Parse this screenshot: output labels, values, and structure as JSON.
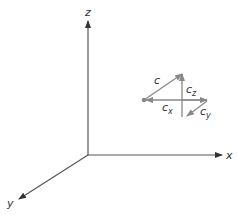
{
  "diagram": {
    "axes": {
      "x_label": "x",
      "y_label": "y",
      "z_label": "z"
    },
    "vectors": {
      "c": {
        "label": "c"
      },
      "cx": {
        "base": "c",
        "sub": "x"
      },
      "cy": {
        "base": "c",
        "sub": "y"
      },
      "cz": {
        "base": "c",
        "sub": "z"
      }
    },
    "colors": {
      "axis": "#333333",
      "vector": "#888888"
    }
  }
}
